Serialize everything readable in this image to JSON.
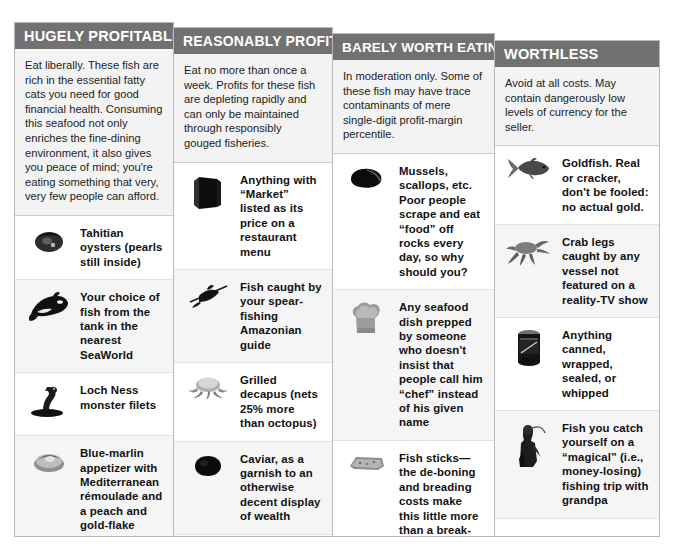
{
  "poster": {
    "background": "#ffffff",
    "header_bg": "#717171",
    "header_fg": "#ffffff",
    "panel_border": "#b9b9b9",
    "intro_bg": "#f3f3f3",
    "text_color": "#111111"
  },
  "columns": [
    {
      "id": "hugely-profitable",
      "header": "HUGELY PROFITABLE",
      "intro": "Eat liberally. These fish are rich in the essential fatty cats you need for good financial health. Consuming this seafood not only enriches the fine-dining environment, it also gives you peace of mind; you're eating something that very, very few people can afford.",
      "items": [
        {
          "icon": "oyster-icon",
          "text": "Tahitian oysters (pearls still inside)"
        },
        {
          "icon": "orca-icon",
          "text": "Your choice of fish from the tank in the nearest SeaWorld"
        },
        {
          "icon": "loch-ness-monster-icon",
          "text": "Loch Ness monster filets"
        },
        {
          "icon": "blue-marlin-appetizer-icon",
          "text": "Blue-marlin appetizer with Mediterranean rémoulade and a peach and gold-flake glaze (available at Jean Georges at Trump International Hotel & Tower, New York)"
        }
      ],
      "feature_art": null
    },
    {
      "id": "reasonably-profitable",
      "header": "REASONABLY PROFITABLE",
      "intro": "Eat no more than once a week. Profits for these fish are depleting rapidly and can only be maintained through responsibly gouged fisheries.",
      "items": [
        {
          "icon": "menu-icon",
          "text": "Anything with “Market” listed as its price on a restaurant menu"
        },
        {
          "icon": "spear-fish-icon",
          "text": "Fish caught by your spear-fishing Amazonian guide"
        },
        {
          "icon": "grilled-decapus-icon",
          "text": "Grilled decapus (nets 25% more than octopus)"
        },
        {
          "icon": "caviar-icon",
          "text": "Caviar, as a garnish to an otherwise decent display of wealth"
        }
      ],
      "feature_art": "large-dark-fish-photo"
    },
    {
      "id": "barely-worth-eating",
      "header": "BARELY WORTH EATING",
      "intro": "In moderation only. Some of these fish may have trace contaminants of mere single-digit profit-margin percentile.",
      "items": [
        {
          "icon": "mussel-icon",
          "text": "Mussels, scallops, etc. Poor people scrape and eat “food” off rocks every day, so why should you?"
        },
        {
          "icon": "chef-hat-icon",
          "text": "Any seafood dish prepped by someone who doesn't insist that people call him “chef” instead of his given name"
        },
        {
          "icon": "fish-stick-icon",
          "text": "Fish sticks— the de-boning and breading costs make this little more than a break-even product"
        },
        {
          "icon": "fish-sandwich-icon",
          "text": "McDonald's Filet-O-Fish product, like fish sticks, is a volume business. You'd have to eat a thousand for McDonald's to see return of dollar one."
        }
      ],
      "feature_art": null
    },
    {
      "id": "worthless",
      "header": "WORTHLESS",
      "intro": "Avoid at all costs. May contain dangerously low levels of currency for the seller.",
      "items": [
        {
          "icon": "goldfish-icon",
          "text": "Goldfish. Real or cracker, don't be fooled: no actual gold."
        },
        {
          "icon": "crab-icon",
          "text": "Crab legs caught by any vessel not featured on a reality-TV show"
        },
        {
          "icon": "canned-food-icon",
          "text": "Anything canned, wrapped, sealed, or whipped"
        },
        {
          "icon": "grandpa-fishing-icon",
          "text": "Fish you catch yourself on a “magical” (i.e., money-losing) fishing trip with grandpa"
        }
      ],
      "feature_art": "large-shrimp-photo"
    }
  ]
}
